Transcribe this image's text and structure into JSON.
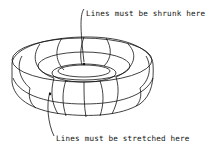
{
  "diagram": {
    "labels": {
      "top": "Lines must be shrunk here",
      "bottom": "Lines must be stretched here"
    },
    "stroke_color": "#111111",
    "background": "#ffffff"
  }
}
